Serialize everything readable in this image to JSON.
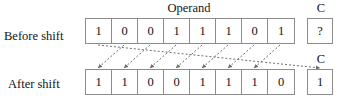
{
  "figure": {
    "operand_title": "Operand",
    "carry_title": "C",
    "rows": [
      {
        "id": "before",
        "label": "Before shift",
        "bits": [
          "1",
          "0",
          "0",
          "1",
          "1",
          "1",
          "0",
          "1"
        ],
        "carry": "?"
      },
      {
        "id": "after",
        "label": "After shift",
        "bits": [
          "1",
          "1",
          "0",
          "0",
          "1",
          "1",
          "1",
          "0"
        ],
        "carry": "1"
      }
    ],
    "shift": {
      "direction": "left",
      "arrow_count": 8,
      "arrow_style": "dashed",
      "description": "Each operand bit moves one position left; the most significant bit moves into the carry flag."
    },
    "colors": {
      "box_border": "#8c8c8c",
      "text": "#141414",
      "arrow": "#6e6e6e",
      "background": "#ffffff"
    }
  }
}
